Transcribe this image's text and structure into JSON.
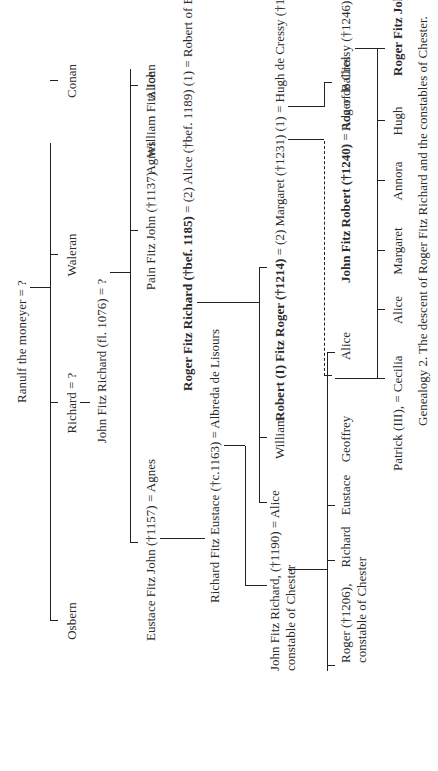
{
  "caption": "Genealogy 2. The descent of Roger Fitz Richard and the constables of Chester.",
  "generations": {
    "g1": {
      "ranulf": "Ranulf the moneyer = ?"
    },
    "g2": {
      "osbern": "Osbern",
      "richard": "Richard = ?",
      "waleran": "Waleran",
      "conan": "Conan"
    },
    "g2b": {
      "john_fitz_richard": "John Fitz Richard (fl. 1076) = ?"
    },
    "g3": {
      "eustace": "Eustace Fitz John (†1157) = Agnes",
      "pain": "Pain Fitz John (†1137)",
      "william": "William Fitz John",
      "agnes": "Agnes",
      "alice": "Alice"
    },
    "g4": {
      "richard_fitz_eustace": "Richard Fitz Eustace (†c.1163) = Albreda de Lisours",
      "roger_fitz_richard": "Roger Fitz Richard (†bef. 1185)",
      "roger_fitz_richard_marr": " = (2) Alice (†bef. 1189) (1) = Robert of Essex (†c.1132/40)"
    },
    "g5": {
      "john_fitz_richard_line1": "John Fitz Richard, (†1190) = Alice",
      "john_fitz_richard_line2": "constable of Chester",
      "william": "William",
      "robert_fitz_roger": "Robert (I) Fitz Roger (†1214)",
      "robert_marr": " = (2) Margaret (†1231) (1) = Hugh de Cressy (†1188/9)"
    },
    "g6": {
      "roger_line1": "Roger (†1206),",
      "roger_line2": "constable of Chester",
      "richard": "Richard",
      "eustace": "Eustace",
      "geoffrey": "Geoffrey",
      "alice": "Alice",
      "john_fitz_robert": "John Fitz Robert (†1240)",
      "john_fitz_robert_marr": " = Ada of Balliol",
      "roger_de_cressy": "Roger de Cressy (†1246)"
    },
    "g7": {
      "patrick": "Patrick (III), = Cecilia",
      "alice": "Alice",
      "margaret": "Margaret",
      "annora": "Annora",
      "hugh": "Hugh",
      "roger_fitz_john": "Roger Fitz John (†1249)",
      "roger_fitz_john_marr": " = Isabella of Dunbar"
    }
  }
}
